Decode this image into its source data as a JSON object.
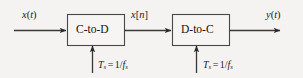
{
  "diagram": {
    "colors": {
      "background": "#f5f3f1",
      "line": "#3a3836",
      "box_border": "#4a4845",
      "box_fill": "#f7f5f3",
      "text": "#1d1b1a"
    },
    "blocks": [
      {
        "id": "c-to-d",
        "label": "C-to-D"
      },
      {
        "id": "d-to-c",
        "label": "D-to-C"
      }
    ],
    "signals": {
      "input": {
        "base": "x",
        "open": "(",
        "arg": "t",
        "close": ")"
      },
      "intermediate": {
        "base": "x",
        "open": "[",
        "arg": "n",
        "close": "]"
      },
      "output": {
        "base": "y",
        "open": "(",
        "arg": "t",
        "close": ")"
      }
    },
    "sampling": {
      "symbol": "T",
      "symbol_sub": "s",
      "equals": "=",
      "numerator": "1/",
      "denominator": "f",
      "denominator_sub": "s",
      "full_text": "Ts = 1/fs",
      "count": 2
    }
  }
}
